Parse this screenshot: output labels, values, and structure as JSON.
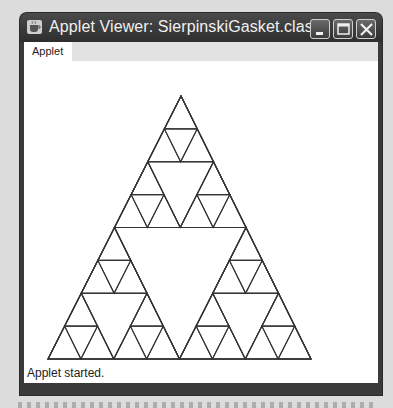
{
  "window": {
    "title": "Applet Viewer: SierpinskiGasket.class",
    "icon": "java-cup-icon",
    "controls": [
      {
        "name": "minimize-button",
        "icon": "minimize-icon"
      },
      {
        "name": "maximize-button",
        "icon": "maximize-icon"
      },
      {
        "name": "close-button",
        "icon": "close-icon"
      }
    ]
  },
  "menubar": {
    "items": [
      {
        "label": "Applet"
      }
    ]
  },
  "applet": {
    "drawing": "Sierpinski gasket",
    "order": 3,
    "vertices": {
      "apex": [
        157,
        35
      ],
      "left": [
        24,
        298
      ],
      "right": [
        287,
        298
      ]
    },
    "line_color": "#333333"
  },
  "status": {
    "text": "Applet started."
  }
}
